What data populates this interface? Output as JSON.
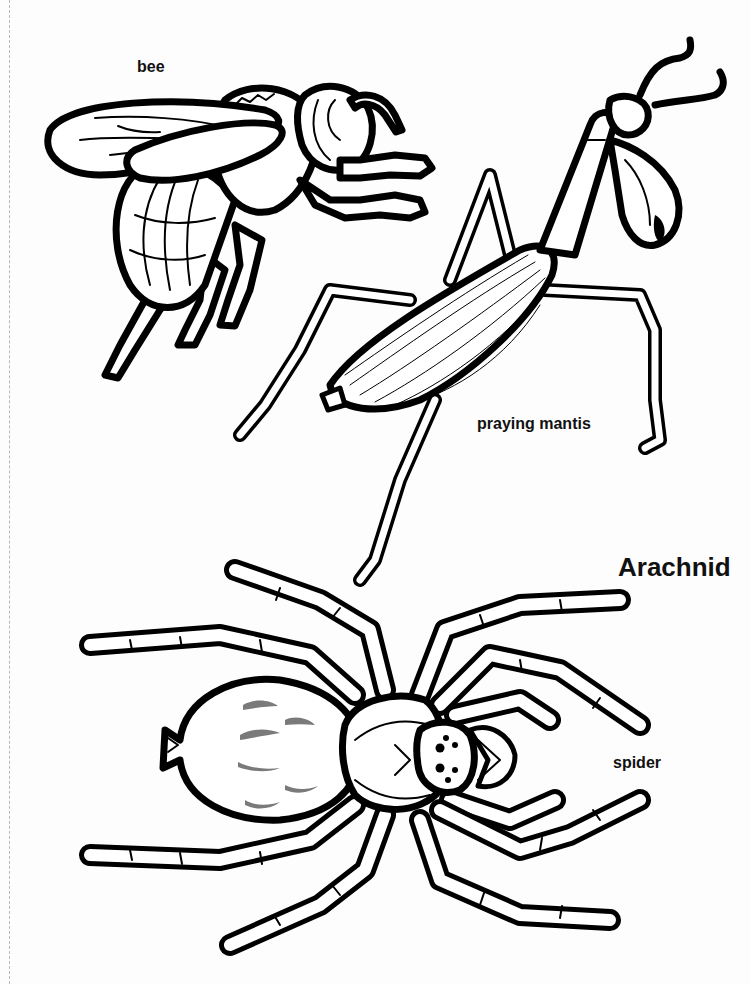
{
  "page": {
    "type": "coloring worksheet",
    "labels": {
      "bee": "bee",
      "praying_mantis": "praying mantis",
      "section_heading": "Arachnid",
      "spider": "spider"
    },
    "illustrations": [
      {
        "name": "bee",
        "style": "black line art"
      },
      {
        "name": "praying mantis",
        "style": "black line art"
      },
      {
        "name": "spider",
        "style": "black line art with gray abdomen markings"
      }
    ],
    "colors": {
      "line": "#000000",
      "background": "#fdfdfd",
      "spider_markings": "#7a7a7a",
      "cut_line": "#b8b8b8"
    }
  }
}
